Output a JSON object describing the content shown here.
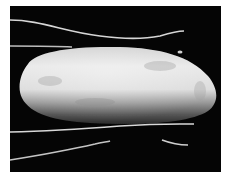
{
  "image": {
    "description": "Grayscale micrograph of an elongated oval cell body with thin bright filaments extending from it against a black background",
    "colors": {
      "background": "#050505",
      "border": "#ffffff",
      "body_light": "#e6e6e6",
      "body_mid": "#b4b4b4",
      "body_dark": "#4a4a4a",
      "filament": "#d8d8d8"
    }
  }
}
